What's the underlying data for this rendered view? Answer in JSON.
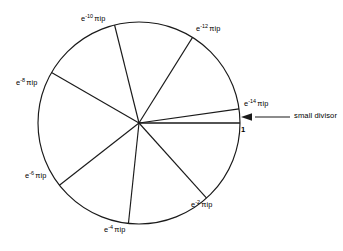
{
  "figure": {
    "type": "unit-circle-roots-diagram",
    "background_color": "#ffffff",
    "stroke_color": "#1a1a1a",
    "circle": {
      "cx": 139,
      "cy": 123,
      "r": 101
    },
    "annotation": {
      "arrow_label": "small divisor",
      "axis_label": "1"
    },
    "spokes": [
      {
        "id": "e-14",
        "base": "e",
        "exponent": "-14",
        "tail": "πip",
        "angle_deg": 8,
        "label_x": 244,
        "label_y": 100
      },
      {
        "id": "e-12",
        "base": "e",
        "exponent": "-12",
        "tail": "πip",
        "angle_deg": 58,
        "label_x": 196,
        "label_y": 25
      },
      {
        "id": "e-10",
        "base": "e",
        "exponent": "-10",
        "tail": "πip",
        "angle_deg": 104,
        "label_x": 81,
        "label_y": 15
      },
      {
        "id": "e-8",
        "base": "e",
        "exponent": "-8",
        "tail": "πip",
        "angle_deg": 150,
        "label_x": 16,
        "label_y": 79
      },
      {
        "id": "e-6",
        "base": "e",
        "exponent": "-6",
        "tail": "πip",
        "angle_deg": 218,
        "label_x": 25,
        "label_y": 172
      },
      {
        "id": "e-4",
        "base": "e",
        "exponent": "-4",
        "tail": "πip",
        "angle_deg": 264,
        "label_x": 104,
        "label_y": 226
      },
      {
        "id": "e-2",
        "base": "e",
        "exponent": "-2",
        "tail": "πip",
        "angle_deg": 312,
        "label_x": 191,
        "label_y": 201
      }
    ]
  }
}
